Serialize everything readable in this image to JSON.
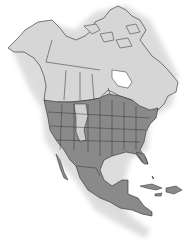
{
  "map": {
    "title": "North America range map",
    "colors": {
      "background": "#ffffff",
      "land_outside_range": "#d6d6d6",
      "range": "#8a8a8a",
      "excluded_region": "#cfcfcf",
      "border": "#2b2b2b",
      "shadow": "#bfbfbf"
    },
    "regions": [
      {
        "name": "Alaska",
        "status": "outside-range"
      },
      {
        "name": "Canada",
        "status": "outside-range"
      },
      {
        "name": "Greenland (partial)",
        "status": "outside-range"
      },
      {
        "name": "Contiguous United States",
        "status": "in-range"
      },
      {
        "name": "Southern Canada border strip",
        "status": "in-range"
      },
      {
        "name": "Mexico",
        "status": "in-range"
      },
      {
        "name": "Central America",
        "status": "in-range"
      },
      {
        "name": "Caribbean islands",
        "status": "in-range"
      },
      {
        "name": "Montana / Wyoming / Colorado strip",
        "status": "outside-range"
      }
    ]
  }
}
